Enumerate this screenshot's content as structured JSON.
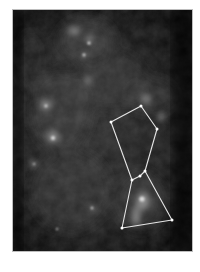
{
  "image": {
    "subject": "grayscale sky image with constellation overlay",
    "frame": {
      "x": 12,
      "y": 9,
      "width": 181,
      "height": 243,
      "border_color": "#bdbdbd",
      "background": "#0a0a0a"
    },
    "line_color": "#e6e6e6",
    "constellation": {
      "name": "Orion",
      "stars": [
        {
          "id": "s1",
          "x": 110,
          "y": 121
        },
        {
          "id": "s2",
          "x": 140,
          "y": 105
        },
        {
          "id": "s3",
          "x": 156,
          "y": 128
        },
        {
          "id": "s4",
          "x": 144,
          "y": 170
        },
        {
          "id": "s5",
          "x": 139,
          "y": 175
        },
        {
          "id": "s6",
          "x": 131,
          "y": 179
        },
        {
          "id": "s7",
          "x": 171,
          "y": 219
        },
        {
          "id": "s8",
          "x": 121,
          "y": 227
        }
      ],
      "lines": [
        [
          "s1",
          "s2"
        ],
        [
          "s2",
          "s3"
        ],
        [
          "s3",
          "s4"
        ],
        [
          "s1",
          "s6"
        ],
        [
          "s4",
          "s5"
        ],
        [
          "s5",
          "s6"
        ],
        [
          "s4",
          "s7"
        ],
        [
          "s6",
          "s8"
        ],
        [
          "s8",
          "s7"
        ]
      ]
    }
  }
}
